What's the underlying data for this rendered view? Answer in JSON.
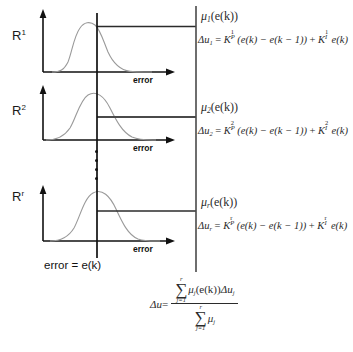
{
  "figure": {
    "type": "fuzzy-inference-diagram",
    "axis_label": "error",
    "error_caption": "error = e(k)",
    "rules": [
      {
        "rule_label": "R",
        "rule_superscript": "1",
        "mu_symbol": "μ",
        "mu_subscript": "1",
        "mu_argument": "(e(k))",
        "delta_u": "Δu",
        "delta_u_subscript": "1",
        "gain_p": "K",
        "gain_p_sub": "P",
        "gain_p_sup": "1",
        "error_diff": "(e(k) − e(k − 1))",
        "plus": "+",
        "gain_i": "K",
        "gain_i_sub": "I",
        "gain_i_sup": "1",
        "error_term": "e(k)",
        "equals": "="
      },
      {
        "rule_label": "R",
        "rule_superscript": "2",
        "mu_symbol": "μ",
        "mu_subscript": "2",
        "mu_argument": "(e(k))",
        "delta_u": "Δu",
        "delta_u_subscript": "2",
        "gain_p": "K",
        "gain_p_sub": "P",
        "gain_p_sup": "2",
        "error_diff": "(e(k) − e(k − 1))",
        "plus": "+",
        "gain_i": "K",
        "gain_i_sub": "I",
        "gain_i_sup": "2",
        "error_term": "e(k)",
        "equals": "="
      },
      {
        "rule_label": "R",
        "rule_superscript": "r",
        "mu_symbol": "μ",
        "mu_subscript": "r",
        "mu_argument": "(e(k))",
        "delta_u": "Δu",
        "delta_u_subscript": "r",
        "gain_p": "K",
        "gain_p_sub": "P",
        "gain_p_sup": "r",
        "error_diff": "(e(k) − e(k − 1))",
        "plus": "+",
        "gain_i": "K",
        "gain_i_sub": "I",
        "gain_i_sup": "r",
        "error_term": "e(k)",
        "equals": "="
      }
    ],
    "ellipsis_dots": 4,
    "defuzzification": {
      "lhs": "Δu",
      "equals": "=",
      "numerator": {
        "sum_upper": "r",
        "sum_symbol": "∑",
        "sum_lower": "j=1",
        "term_mu": "μ",
        "term_mu_sub": "j",
        "term_arg": "(e(k))",
        "term_delta": "Δu",
        "term_delta_sub": "j"
      },
      "denominator": {
        "sum_upper": "r",
        "sum_symbol": "∑",
        "sum_lower": "j=1",
        "term_mu": "μ",
        "term_mu_sub": "j"
      }
    },
    "colors": {
      "curve": "#9a9a9a",
      "axis": "#111111",
      "bus": "#4a4a4a",
      "text": "#2b2b2b"
    }
  }
}
